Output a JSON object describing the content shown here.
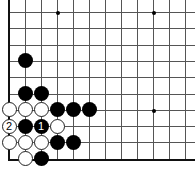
{
  "board": {
    "origin_x": 9,
    "origin_y": 12,
    "spacing_x": 16,
    "spacing_y": 16.3,
    "cols": 12,
    "rows": 10,
    "line_color": "#555555",
    "edges": [
      "left",
      "bottom"
    ],
    "star_points": [
      [
        3,
        0
      ],
      [
        9,
        0
      ],
      [
        9,
        6
      ]
    ]
  },
  "stones": [
    {
      "color": "black",
      "col": 1,
      "row": 3,
      "label": ""
    },
    {
      "color": "black",
      "col": 1,
      "row": 5,
      "label": ""
    },
    {
      "color": "black",
      "col": 2,
      "row": 5,
      "label": ""
    },
    {
      "color": "white",
      "col": 0,
      "row": 6,
      "label": ""
    },
    {
      "color": "white",
      "col": 1,
      "row": 6,
      "label": ""
    },
    {
      "color": "white",
      "col": 2,
      "row": 6,
      "label": ""
    },
    {
      "color": "black",
      "col": 3,
      "row": 6,
      "label": ""
    },
    {
      "color": "black",
      "col": 4,
      "row": 6,
      "label": ""
    },
    {
      "color": "black",
      "col": 5,
      "row": 6,
      "label": ""
    },
    {
      "color": "white",
      "col": 0,
      "row": 7,
      "label": "2"
    },
    {
      "color": "black",
      "col": 1,
      "row": 7,
      "label": ""
    },
    {
      "color": "black",
      "col": 2,
      "row": 7,
      "label": "1"
    },
    {
      "color": "white",
      "col": 3,
      "row": 7,
      "label": ""
    },
    {
      "color": "white",
      "col": 0,
      "row": 8,
      "label": ""
    },
    {
      "color": "white",
      "col": 1,
      "row": 8,
      "label": ""
    },
    {
      "color": "white",
      "col": 2,
      "row": 8,
      "label": ""
    },
    {
      "color": "black",
      "col": 3,
      "row": 8,
      "label": ""
    },
    {
      "color": "black",
      "col": 4,
      "row": 8,
      "label": ""
    },
    {
      "color": "white",
      "col": 1,
      "row": 9,
      "label": ""
    },
    {
      "color": "black",
      "col": 2,
      "row": 9,
      "label": ""
    }
  ]
}
